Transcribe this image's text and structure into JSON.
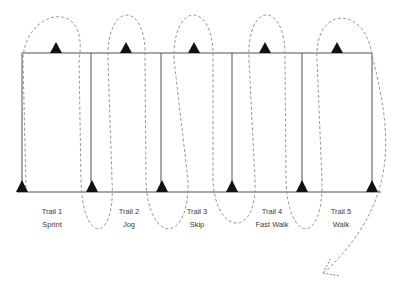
{
  "diagram": {
    "colors": {
      "line": "#3c3c3c",
      "triangle": "#111111",
      "dashed": "#8a8a8a",
      "text": "#3a3a3a"
    },
    "trails": [
      {
        "name": "Trail 1",
        "activity": "Sprint"
      },
      {
        "name": "Trail 2",
        "activity": "Jog"
      },
      {
        "name": "Trail 3",
        "activity": "Skip"
      },
      {
        "name": "Trail 4",
        "activity": "Fast Walk"
      },
      {
        "name": "Trail 5",
        "activity": "Walk"
      }
    ],
    "markers": {
      "top_cones": 5,
      "bottom_cones": 6,
      "icon": "cone-triangle-icon"
    },
    "path": {
      "style": "dashed serpentine",
      "end": "arrow-icon"
    }
  }
}
